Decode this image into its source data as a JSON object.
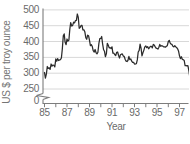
{
  "chart_data": {
    "type": "line",
    "title": "",
    "ylabel": "US $ per troy ounce",
    "xlabel": "Year",
    "x_tick_labels": [
      "85",
      "87",
      "89",
      "91",
      "93",
      "95",
      "97"
    ],
    "x_tick_years": [
      85,
      86,
      87,
      88,
      89,
      90,
      91,
      92,
      93,
      94,
      95,
      96,
      97
    ],
    "y_tick_labels": [
      "500",
      "450",
      "400",
      "350",
      "300",
      "250",
      "0"
    ],
    "y_gridline_values": [
      500,
      450,
      400,
      350,
      300,
      250
    ],
    "y_axis_break_between": [
      0,
      250
    ],
    "ylim": [
      250,
      500
    ],
    "x_range_years": [
      85,
      98
    ],
    "interval": "monthly",
    "x_start_year": 85,
    "series": [
      {
        "name": "US $ per troy ounce",
        "values": [
          302,
          284,
          298,
          321,
          315,
          317,
          312,
          329,
          322,
          326,
          325,
          320,
          345,
          338,
          346,
          340,
          342,
          343,
          348,
          376,
          418,
          424,
          398,
          390,
          408,
          401,
          405,
          438,
          460,
          449,
          450,
          461,
          459,
          466,
          467,
          487,
          476,
          442,
          444,
          451,
          451,
          437,
          437,
          431,
          412,
          407,
          420,
          418,
          404,
          387,
          390,
          384,
          371,
          367,
          375,
          364,
          361,
          366,
          394,
          409,
          410,
          416,
          393,
          374,
          369,
          352,
          362,
          394,
          388,
          380,
          381,
          378,
          383,
          363,
          363,
          358,
          356,
          366,
          367,
          356,
          348,
          358,
          360,
          361,
          354,
          353,
          344,
          338,
          337,
          340,
          353,
          343,
          345,
          338,
          334,
          334,
          329,
          329,
          330,
          342,
          367,
          372,
          392,
          378,
          355,
          364,
          373,
          383,
          386,
          381,
          384,
          377,
          381,
          385,
          385,
          380,
          391,
          389,
          384,
          379,
          378,
          376,
          382,
          391,
          385,
          387,
          386,
          383,
          383,
          382,
          385,
          387,
          400,
          404,
          396,
          392,
          391,
          385,
          383,
          387,
          383,
          381,
          377,
          369,
          355,
          346,
          352,
          344,
          343,
          340,
          324,
          324,
          323,
          324,
          307,
          288
        ]
      }
    ],
    "colors": {
      "line": "#2b2b2b",
      "grid": "#d8d8d8",
      "axis": "#7d7d7d",
      "text": "#6a6a6a"
    },
    "grid": "horizontal-only",
    "legend": "none"
  }
}
